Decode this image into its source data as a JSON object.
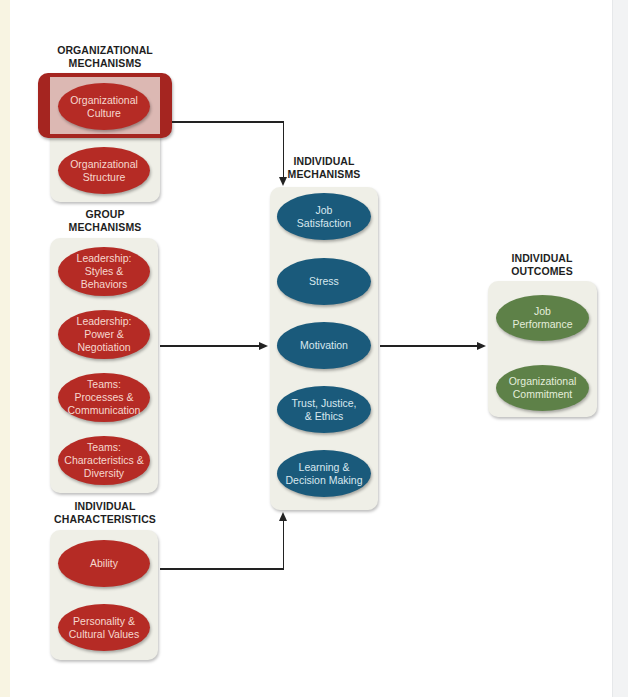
{
  "colors": {
    "organizational": "#b52b25",
    "group": "#b52b25",
    "individual_characteristics": "#b52b25",
    "individual_mechanisms": "#1a5a7b",
    "individual_outcomes": "#5e8148",
    "highlight": "#a52520",
    "panel": "#efefe7"
  },
  "organizational": {
    "heading_line1": "ORGANIZATIONAL",
    "heading_line2": "MECHANISMS",
    "items": [
      {
        "line1": "Organizational",
        "line2": "Culture",
        "highlighted": true
      },
      {
        "line1": "Organizational",
        "line2": "Structure"
      }
    ]
  },
  "group": {
    "heading_line1": "GROUP",
    "heading_line2": "MECHANISMS",
    "items": [
      {
        "line1": "Leadership:",
        "line2": "Styles &",
        "line3": "Behaviors"
      },
      {
        "line1": "Leadership:",
        "line2": "Power &",
        "line3": "Negotiation"
      },
      {
        "line1": "Teams:",
        "line2": "Processes &",
        "line3": "Communication"
      },
      {
        "line1": "Teams:",
        "line2": "Characteristics &",
        "line3": "Diversity"
      }
    ]
  },
  "individual_characteristics": {
    "heading_line1": "INDIVIDUAL",
    "heading_line2": "CHARACTERISTICS",
    "items": [
      {
        "line1": "Ability"
      },
      {
        "line1": "Personality &",
        "line2": "Cultural Values"
      }
    ]
  },
  "individual_mechanisms": {
    "heading_line1": "INDIVIDUAL",
    "heading_line2": "MECHANISMS",
    "items": [
      {
        "line1": "Job",
        "line2": "Satisfaction"
      },
      {
        "line1": "Stress"
      },
      {
        "line1": "Motivation"
      },
      {
        "line1": "Trust, Justice,",
        "line2": "& Ethics"
      },
      {
        "line1": "Learning &",
        "line2": "Decision Making"
      }
    ]
  },
  "individual_outcomes": {
    "heading_line1": "INDIVIDUAL",
    "heading_line2": "OUTCOMES",
    "items": [
      {
        "line1": "Job",
        "line2": "Performance"
      },
      {
        "line1": "Organizational",
        "line2": "Commitment"
      }
    ]
  },
  "connections": [
    {
      "from": "Organizational Culture",
      "to": "Individual Mechanisms"
    },
    {
      "from": "Group Mechanisms",
      "to": "Individual Mechanisms"
    },
    {
      "from": "Individual Characteristics",
      "to": "Individual Mechanisms"
    },
    {
      "from": "Individual Mechanisms",
      "to": "Individual Outcomes"
    }
  ]
}
